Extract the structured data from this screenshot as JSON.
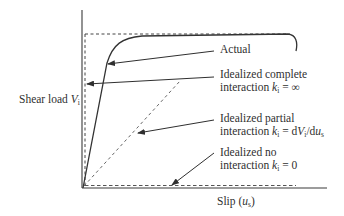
{
  "diagram": {
    "type": "shear load vs slip relationship",
    "y_axis_label": {
      "text": "Shear load ",
      "symbol": "V",
      "subscript": "i"
    },
    "x_axis_label": {
      "text": "Slip (",
      "symbol": "u",
      "subscript": "s",
      "close": ")"
    },
    "curves": [
      {
        "id": "actual",
        "style": "solid",
        "description": "Actual nonlinear shear load–slip curve"
      },
      {
        "id": "complete",
        "style": "dashed",
        "description": "Vertical then horizontal (infinite stiffness)"
      },
      {
        "id": "partial",
        "style": "dashed",
        "description": "Linear with finite slope"
      },
      {
        "id": "none",
        "style": "dashed",
        "description": "Along slip axis (zero stiffness)"
      }
    ],
    "annotations": {
      "actual": {
        "line1": "Actual"
      },
      "complete": {
        "line1": "Idealized complete",
        "line2_prefix": "interaction ",
        "k": "k",
        "k_sub": "i",
        "line2_suffix": " = ∞"
      },
      "partial": {
        "line1": "Idealized partial",
        "line2_prefix": "interaction ",
        "k": "k",
        "k_sub": "i",
        "eq": " = d",
        "V": "V",
        "V_sub": "i",
        "slash": "/d",
        "u": "u",
        "u_sub": "s"
      },
      "none": {
        "line1": "Idealized no",
        "line2_prefix": "interaction ",
        "k": "k",
        "k_sub": "i",
        "line2_suffix": " = 0"
      }
    },
    "colors": {
      "ink": "#2f2f2f",
      "dashed": "#555555",
      "background": "#ffffff"
    }
  }
}
